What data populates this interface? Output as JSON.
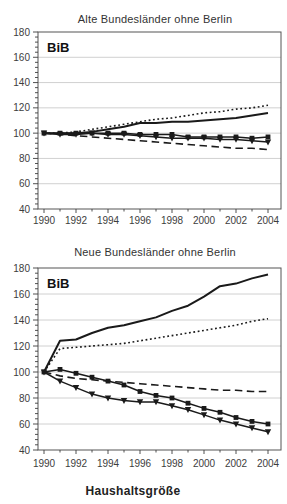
{
  "page": {
    "bottom_axis_label": "Haushaltsgröße"
  },
  "chart_data": [
    {
      "type": "line",
      "title": "Alte Bundesländer ohne Berlin",
      "inner_label": "BiB",
      "xlabel": "",
      "ylabel": "",
      "ylim": [
        40,
        180
      ],
      "yticks": [
        40,
        60,
        80,
        100,
        120,
        140,
        160,
        180
      ],
      "xticks": [
        1990,
        1992,
        1994,
        1996,
        1998,
        2000,
        2002,
        2004
      ],
      "x": [
        1990,
        1991,
        1992,
        1993,
        1994,
        1995,
        1996,
        1997,
        1998,
        1999,
        2000,
        2001,
        2002,
        2003,
        2004
      ],
      "grid": "horizontal-light",
      "legend": "none",
      "series": [
        {
          "name": "dotted-line",
          "style": "dotted",
          "values": [
            100,
            100,
            101,
            103,
            105,
            107,
            109,
            111,
            112,
            114,
            116,
            117,
            119,
            120,
            122
          ]
        },
        {
          "name": "solid-line",
          "style": "solid",
          "values": [
            100,
            100,
            100,
            101,
            103,
            105,
            108,
            108,
            109,
            109,
            110,
            111,
            112,
            114,
            116
          ]
        },
        {
          "name": "dashed-line",
          "style": "dashed",
          "values": [
            100,
            99,
            98,
            97,
            96,
            95,
            94,
            93,
            92,
            91,
            90,
            89,
            88,
            88,
            87
          ]
        },
        {
          "name": "square-marker-line",
          "style": "marker-square",
          "values": [
            100,
            100,
            100,
            100,
            100,
            100,
            99,
            99,
            99,
            97,
            97,
            97,
            97,
            96,
            97
          ]
        },
        {
          "name": "triangle-marker-line",
          "style": "marker-triangle",
          "values": [
            100,
            99,
            99,
            100,
            99,
            99,
            98,
            97,
            96,
            96,
            96,
            95,
            95,
            94,
            93
          ]
        }
      ]
    },
    {
      "type": "line",
      "title": "Neue Bundesländer ohne Berlin",
      "inner_label": "BiB",
      "xlabel": "Haushaltsgröße",
      "ylabel": "",
      "ylim": [
        40,
        180
      ],
      "yticks": [
        40,
        60,
        80,
        100,
        120,
        140,
        160,
        180
      ],
      "xticks": [
        1990,
        1992,
        1994,
        1996,
        1998,
        2000,
        2002,
        2004
      ],
      "x": [
        1990,
        1991,
        1992,
        1993,
        1994,
        1995,
        1996,
        1997,
        1998,
        1999,
        2000,
        2001,
        2002,
        2003,
        2004
      ],
      "grid": "horizontal-light",
      "legend": "none",
      "series": [
        {
          "name": "solid-line",
          "style": "solid",
          "values": [
            100,
            124,
            125,
            130,
            134,
            136,
            139,
            142,
            147,
            151,
            158,
            166,
            168,
            172,
            175
          ]
        },
        {
          "name": "dotted-line",
          "style": "dotted",
          "values": [
            100,
            118,
            119,
            120,
            121,
            122,
            124,
            126,
            128,
            130,
            132,
            134,
            136,
            139,
            141
          ]
        },
        {
          "name": "dashed-line",
          "style": "dashed",
          "values": [
            100,
            97,
            95,
            94,
            93,
            92,
            91,
            90,
            89,
            88,
            87,
            86,
            86,
            85,
            85
          ]
        },
        {
          "name": "square-marker-line",
          "style": "marker-square",
          "values": [
            100,
            102,
            99,
            96,
            93,
            90,
            85,
            82,
            80,
            76,
            72,
            69,
            65,
            62,
            60
          ]
        },
        {
          "name": "triangle-marker-line",
          "style": "marker-triangle",
          "values": [
            100,
            93,
            88,
            83,
            80,
            78,
            77,
            77,
            74,
            71,
            67,
            63,
            60,
            57,
            54
          ]
        }
      ]
    }
  ],
  "colors": {
    "line": "#1a1a1a",
    "grid": "#c4c4c4",
    "border": "#555555",
    "text": "#333333",
    "tick_text": "#3d3d3d",
    "background": "#ffffff"
  }
}
